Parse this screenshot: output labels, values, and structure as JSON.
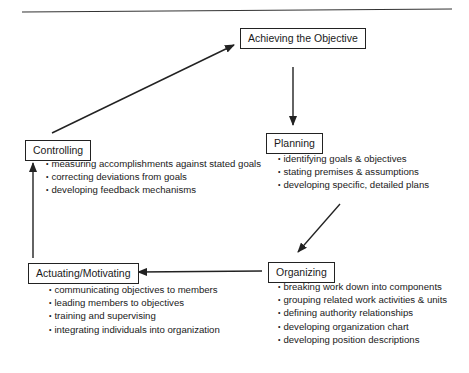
{
  "diagram": {
    "type": "management-cycle-flowchart",
    "nodes": [
      {
        "id": "achieving",
        "label": "Achieving the Objective",
        "items": []
      },
      {
        "id": "planning",
        "label": "Planning",
        "items": [
          "identifying goals & objectives",
          "stating premises & assumptions",
          "developing specific, detailed plans"
        ]
      },
      {
        "id": "organizing",
        "label": "Organizing",
        "items": [
          "breaking work down into components",
          "grouping related work activities & units",
          "defining authority relationships",
          "developing organization chart",
          "developing position descriptions"
        ]
      },
      {
        "id": "actuating",
        "label": "Actuating/Motivating",
        "items": [
          "communicating objectives to members",
          "leading members to objectives",
          "training and supervising",
          "integrating individuals into organization"
        ]
      },
      {
        "id": "controlling",
        "label": "Controlling",
        "items": [
          "measuring accomplishments against stated goals",
          "correcting deviations from goals",
          "developing feedback mechanisms"
        ]
      }
    ],
    "edges": [
      {
        "from": "achieving",
        "to": "planning"
      },
      {
        "from": "planning",
        "to": "organizing"
      },
      {
        "from": "organizing",
        "to": "actuating"
      },
      {
        "from": "actuating",
        "to": "controlling"
      },
      {
        "from": "controlling",
        "to": "achieving"
      }
    ],
    "colors": {
      "stroke": "#222222",
      "background": "#ffffff"
    }
  }
}
